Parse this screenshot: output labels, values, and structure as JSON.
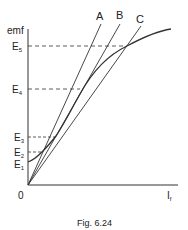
{
  "figure": {
    "caption": "Fig. 6.24",
    "y_axis_label": "emf",
    "x_axis_label": "I",
    "x_axis_label_sub": "f",
    "origin_label": "0",
    "emf_levels": [
      {
        "label": "E",
        "sub": "1"
      },
      {
        "label": "E",
        "sub": "2"
      },
      {
        "label": "E",
        "sub": "3"
      },
      {
        "label": "E",
        "sub": "4"
      },
      {
        "label": "E",
        "sub": "5"
      }
    ],
    "lines": [
      {
        "label": "A"
      },
      {
        "label": "B"
      },
      {
        "label": "C"
      }
    ],
    "colors": {
      "stroke": "#333333",
      "text": "#222222"
    }
  }
}
